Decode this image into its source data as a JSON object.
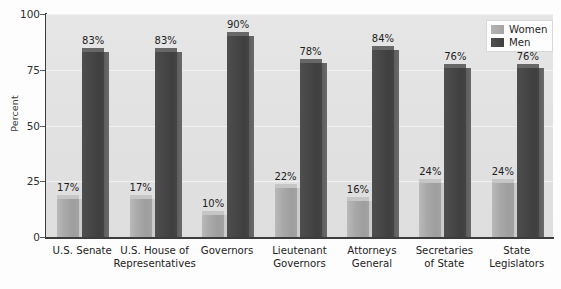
{
  "chart_data": {
    "type": "bar",
    "title": "",
    "xlabel": "",
    "ylabel": "Percent",
    "ylim": [
      0,
      100
    ],
    "yticks": [
      0,
      25,
      50,
      75,
      100
    ],
    "ytick_labels": [
      "0",
      "25",
      "50",
      "75",
      "100"
    ],
    "grid": true,
    "legend_position": "top-right",
    "categories": [
      "U.S. Senate",
      "U.S. House of\nRepresentatives",
      "Governors",
      "Lieutenant\nGovernors",
      "Attorneys\nGeneral",
      "Secretaries\nof State",
      "State\nLegislators"
    ],
    "series": [
      {
        "name": "Women",
        "color": "#a9a9a9",
        "values": [
          17,
          17,
          10,
          22,
          16,
          24,
          24
        ],
        "value_labels": [
          "17%",
          "17%",
          "10%",
          "22%",
          "16%",
          "24%",
          "24%"
        ]
      },
      {
        "name": "Men",
        "color": "#444444",
        "values": [
          83,
          83,
          90,
          78,
          84,
          76,
          76
        ],
        "value_labels": [
          "83%",
          "83%",
          "90%",
          "78%",
          "84%",
          "76%",
          "76%"
        ]
      }
    ]
  },
  "legend": {
    "items": [
      {
        "label": "Women",
        "swatch": "women"
      },
      {
        "label": "Men",
        "swatch": "men"
      }
    ]
  },
  "axis": {
    "y_title": "Percent"
  }
}
